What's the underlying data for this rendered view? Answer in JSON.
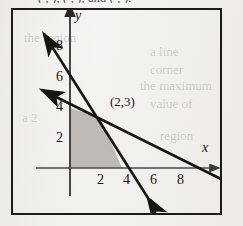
{
  "page": {
    "background_color": "#f0eeeb",
    "ink_color": "#17150f",
    "shade_color": "#b8b5b0",
    "cutoff_header_text": "( , ), ( , ), and ( , ).",
    "bleed_lines": [
      {
        "text": "the region",
        "x": 24,
        "y": 30,
        "size": 13
      },
      {
        "text": "a line",
        "x": 150,
        "y": 44,
        "size": 13
      },
      {
        "text": "corner",
        "x": 150,
        "y": 62,
        "size": 13
      },
      {
        "text": "the maximum",
        "x": 140,
        "y": 78,
        "size": 13
      },
      {
        "text": "value of",
        "x": 150,
        "y": 96,
        "size": 13
      },
      {
        "text": "a 2",
        "x": 22,
        "y": 110,
        "size": 13
      },
      {
        "text": "region",
        "x": 160,
        "y": 128,
        "size": 13
      }
    ]
  },
  "figure": {
    "frame": {
      "x": 11,
      "y": 8,
      "width": 211,
      "height": 207,
      "border_color": "#1d1b19",
      "border_width": 2
    }
  },
  "chart_data": {
    "type": "line",
    "xlabel": "x",
    "ylabel": "y",
    "xlim": [
      -1.6,
      11.9
    ],
    "ylim": [
      -2.5,
      10.9
    ],
    "grid": false,
    "legend": "none",
    "origin_px": {
      "x": 70,
      "y": 168
    },
    "scale_px_per_unit": {
      "x": 13.0,
      "y": 14.9
    },
    "axes": {
      "x_axis": {
        "label": "x",
        "label_px": {
          "x": 205,
          "y": 148
        },
        "arrow_to_px": {
          "x": 215,
          "y": 168
        },
        "ticks": [
          2,
          4,
          6,
          8
        ],
        "tick_labels": [
          "2",
          "4",
          "6",
          "8"
        ],
        "tick_label_px": [
          {
            "text": "2",
            "x": 97,
            "y": 172
          },
          {
            "text": "4",
            "x": 123,
            "y": 172
          },
          {
            "text": "6",
            "x": 150,
            "y": 172
          },
          {
            "text": "8",
            "x": 177,
            "y": 172
          }
        ]
      },
      "y_axis": {
        "label": "y",
        "label_px": {
          "x": 74,
          "y": 9
        },
        "arrow_to_px": {
          "x": 70,
          "y": 11
        },
        "ticks": [
          2,
          4,
          6,
          8
        ],
        "tick_labels": [
          "2",
          "4",
          "6",
          "8"
        ],
        "tick_label_px": [
          {
            "text": "8",
            "x": 56,
            "y": 38
          },
          {
            "text": "6",
            "x": 56,
            "y": 69
          },
          {
            "text": "4",
            "x": 56,
            "y": 99
          },
          {
            "text": "2",
            "x": 56,
            "y": 130
          }
        ]
      }
    },
    "series": [
      {
        "name": "steep-line",
        "description": "Steeply falling line through (2,3); double-headed arrow",
        "type": "line",
        "slope": -1.5,
        "y_intercept": 6,
        "x_intercept": 4,
        "points": [
          [
            -0.3,
            6.45
          ],
          [
            2,
            3
          ],
          [
            4,
            0
          ],
          [
            6.3,
            -3.45
          ]
        ],
        "endpoints_px": {
          "from": {
            "x": 41,
            "y": 29
          },
          "to": {
            "x": 151,
            "y": 202
          }
        },
        "arrowheads": "both",
        "stroke_width": 2.6
      },
      {
        "name": "shallow-line",
        "description": "Gently falling line through (2,3) crossing x-axis near 8; double-headed arrow",
        "type": "line",
        "slope": -0.5,
        "y_intercept": 4,
        "x_intercept": 8,
        "points": [
          [
            -2.2,
            5.1
          ],
          [
            0,
            4
          ],
          [
            2,
            3
          ],
          [
            8,
            0
          ],
          [
            11.5,
            -1.75
          ]
        ],
        "endpoints_px": {
          "from": {
            "x": 37,
            "y": 88
          },
          "to": {
            "x": 226,
            "y": 181
          }
        },
        "arrowheads": "both",
        "stroke_width": 2.6
      }
    ],
    "shaded_region": {
      "name": "feasible-region",
      "fill_color": "#b8b5b0",
      "vertices": [
        [
          0,
          0
        ],
        [
          0,
          4
        ],
        [
          2,
          3
        ],
        [
          4,
          0
        ]
      ],
      "vertices_px": [
        {
          "x": 70,
          "y": 168
        },
        {
          "x": 70,
          "y": 108
        },
        {
          "x": 100,
          "y": 117
        },
        {
          "x": 122,
          "y": 168
        }
      ]
    },
    "annotations": [
      {
        "name": "intersection-point-label",
        "text": "(2,3)",
        "data_point": [
          2,
          3
        ],
        "label_px": {
          "x": 110,
          "y": 95
        }
      }
    ]
  }
}
